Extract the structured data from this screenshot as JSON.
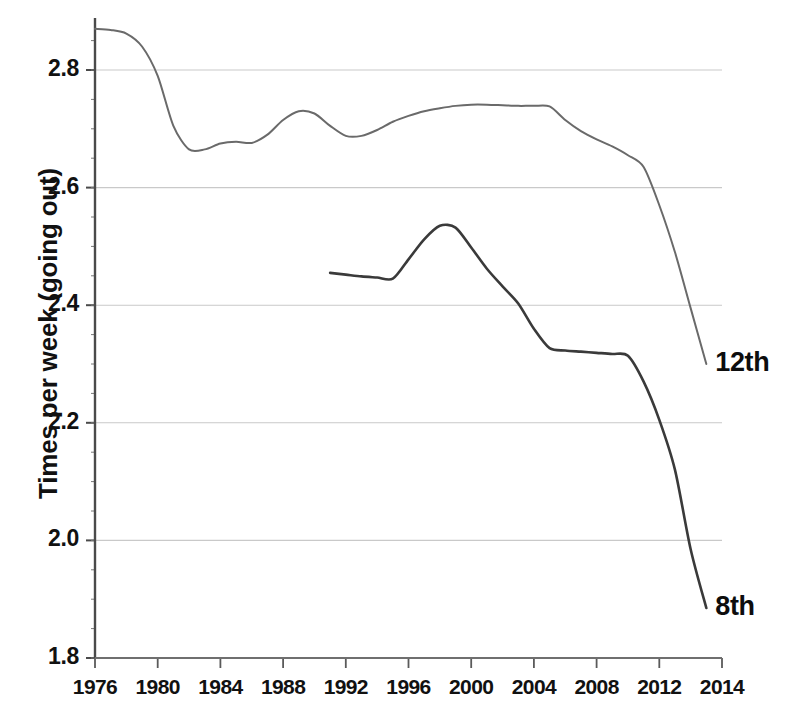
{
  "chart_data": {
    "type": "line",
    "title": "",
    "xlabel": "",
    "ylabel": "Times per week (going out)",
    "xlim": [
      1976,
      2016
    ],
    "ylim": [
      1.8,
      2.9
    ],
    "grid": true,
    "grid_axis": "y",
    "legend": "inline-right-labels",
    "x_ticks": [
      1976,
      1980,
      1984,
      1988,
      1992,
      1996,
      2000,
      2004,
      2008,
      2012,
      2014
    ],
    "x_tick_labels": [
      "1976",
      "1980",
      "1984",
      "1988",
      "1992",
      "1996",
      "2000",
      "2004",
      "2008",
      "2012",
      "2014"
    ],
    "y_ticks": [
      1.8,
      2.0,
      2.2,
      2.4,
      2.6,
      2.8
    ],
    "y_tick_labels": [
      "1.8",
      "2.0",
      "2.2",
      "2.4",
      "2.6",
      "2.8"
    ],
    "series": [
      {
        "name": "12th",
        "label": "12th",
        "color": "#6a6a6a",
        "x": [
          1976,
          1977,
          1978,
          1979,
          1980,
          1981,
          1982,
          1983,
          1984,
          1985,
          1986,
          1987,
          1988,
          1989,
          1990,
          1991,
          1992,
          1993,
          1994,
          1995,
          1996,
          1997,
          1998,
          1999,
          2000,
          2001,
          2002,
          2003,
          2004,
          2005,
          2006,
          2007,
          2008,
          2009,
          2010,
          2011,
          2012,
          2013,
          2014,
          2015
        ],
        "values": [
          2.87,
          2.868,
          2.862,
          2.84,
          2.79,
          2.705,
          2.665,
          2.665,
          2.675,
          2.678,
          2.676,
          2.69,
          2.715,
          2.73,
          2.726,
          2.705,
          2.688,
          2.688,
          2.698,
          2.712,
          2.722,
          2.73,
          2.735,
          2.739,
          2.741,
          2.741,
          2.74,
          2.739,
          2.739,
          2.738,
          2.715,
          2.696,
          2.682,
          2.67,
          2.655,
          2.635,
          2.57,
          2.49,
          2.395,
          2.3
        ]
      },
      {
        "name": "8th",
        "label": "8th",
        "color": "#3a3a3a",
        "x": [
          1991,
          1992,
          1993,
          1994,
          1995,
          1996,
          1997,
          1998,
          1999,
          2000,
          2001,
          2002,
          2003,
          2004,
          2005,
          2006,
          2007,
          2008,
          2009,
          2010,
          2011,
          2012,
          2013,
          2014,
          2015
        ],
        "values": [
          2.455,
          2.452,
          2.449,
          2.447,
          2.445,
          2.478,
          2.512,
          2.535,
          2.532,
          2.498,
          2.462,
          2.432,
          2.403,
          2.36,
          2.327,
          2.323,
          2.321,
          2.319,
          2.317,
          2.314,
          2.27,
          2.205,
          2.12,
          1.985,
          1.885
        ]
      }
    ]
  },
  "axis": {
    "y_title": "Times per week (going out)"
  }
}
